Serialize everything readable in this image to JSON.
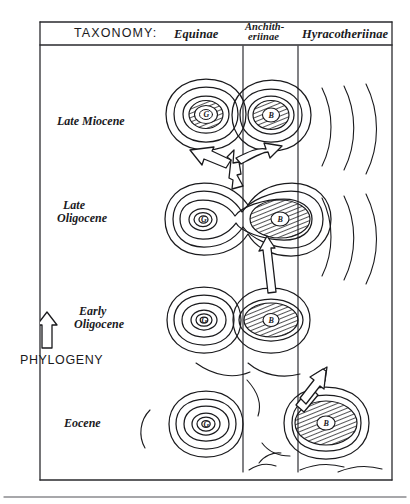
{
  "figure": {
    "title_row": {
      "taxonomy_label": "TAXONOMY:",
      "columns": [
        {
          "id": "equinae",
          "label": "Equinae"
        },
        {
          "id": "anchitheriinae",
          "label_line1": "Anchith-",
          "label_line2": "eriinae"
        },
        {
          "id": "hyracotheriinae",
          "label": "Hyracotheriinae"
        }
      ]
    },
    "time_axis": {
      "arrow_icon": "up-arrow-icon",
      "axis_label": "PHYLOGENY",
      "epochs": [
        {
          "id": "late-miocene",
          "label": "Late Miocene"
        },
        {
          "id": "late-oligocene",
          "label_line1": "Late",
          "label_line2": "Oligocene"
        },
        {
          "id": "early-oligocene",
          "label_line1": "Early",
          "label_line2": "Oligocene"
        },
        {
          "id": "eocene",
          "label": "Eocene"
        }
      ]
    },
    "adaptive_peaks": [
      {
        "id": "peak-late-miocene-equinae",
        "row": "late-miocene",
        "column": "equinae",
        "core_letter": "G",
        "hatched": true
      },
      {
        "id": "peak-late-miocene-anchitheriinae",
        "row": "late-miocene",
        "column": "anchitheriinae",
        "core_letter": "B",
        "hatched": true
      },
      {
        "id": "peak-late-oligocene-equinae",
        "row": "late-oligocene",
        "column": "equinae",
        "core_letter": "G",
        "hatched": false
      },
      {
        "id": "peak-late-oligocene-anchith",
        "row": "late-oligocene",
        "column": "anchitheriinae",
        "core_letter": "B",
        "hatched": true
      },
      {
        "id": "peak-early-oligocene-equinae",
        "row": "early-oligocene",
        "column": "equinae",
        "core_letter": "G",
        "hatched": false
      },
      {
        "id": "peak-early-oligocene-anchith",
        "row": "early-oligocene",
        "column": "anchitheriinae",
        "core_letter": "B",
        "hatched": true
      },
      {
        "id": "peak-eocene-equinae",
        "row": "eocene",
        "column": "equinae",
        "core_letter": "G",
        "hatched": false
      },
      {
        "id": "peak-eocene-hyracotheriinae",
        "row": "eocene",
        "column": "hyracotheriinae",
        "core_letter": "B",
        "hatched": true
      }
    ],
    "transition_arrows": [
      {
        "id": "arrow-eocene-to-early-oligocene",
        "from": "peak-eocene-hyracotheriinae",
        "to": "peak-early-oligocene-anchith",
        "style": "hollow-diagonal"
      },
      {
        "id": "arrow-early-to-late-oligocene",
        "from": "peak-early-oligocene-anchith",
        "to": "peak-late-oligocene-anchith",
        "style": "hollow-vertical"
      },
      {
        "id": "arrow-late-oligocene-branching",
        "from": "peak-late-oligocene-anchith",
        "to": "peak-late-miocene-equinae / peak-late-miocene-anchitheriinae",
        "style": "hollow-branching-y"
      }
    ],
    "colors": {
      "ink": "#1a1a1d",
      "paper": "#ffffff",
      "rule": "#2a2a2e"
    }
  }
}
